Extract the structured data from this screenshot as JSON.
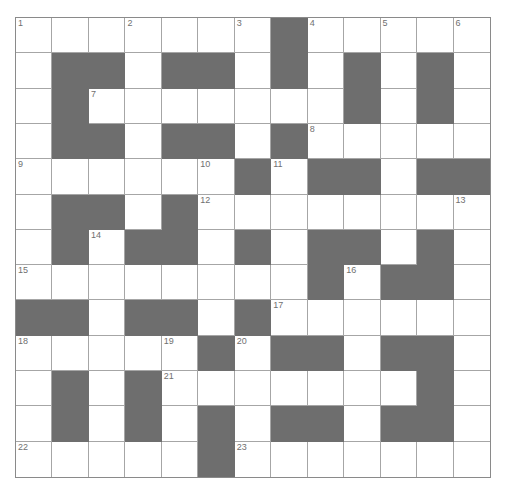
{
  "puzzle": {
    "rows": 13,
    "cols": 13,
    "colors": {
      "block": "#6e6e6e",
      "cell": "#ffffff",
      "grid_line": "#a6a6a6",
      "number": "#707070"
    },
    "layout": [
      "WWWWWWWBWWWWW",
      "WBBWBBWBWBWBW",
      "WBWWWWWWWBWBW",
      "WBBWBBWBWWWWW",
      "WWWWWWBWBBWBB",
      "WBBWBWWWWWWWW",
      "WBWBBWBWBBWBW",
      "WWWWWWWWBWBBW",
      "BBWBBWBWWWWWW",
      "WWWWWBWBBWBBW",
      "WBWBWWWWWWWBW",
      "WBWBWBWBBWBBW",
      "WWWWWBWWWWWWW"
    ],
    "numbers": [
      {
        "row": 0,
        "col": 0,
        "n": "1"
      },
      {
        "row": 0,
        "col": 3,
        "n": "2"
      },
      {
        "row": 0,
        "col": 6,
        "n": "3"
      },
      {
        "row": 0,
        "col": 8,
        "n": "4"
      },
      {
        "row": 0,
        "col": 10,
        "n": "5"
      },
      {
        "row": 0,
        "col": 12,
        "n": "6"
      },
      {
        "row": 2,
        "col": 2,
        "n": "7"
      },
      {
        "row": 3,
        "col": 8,
        "n": "8"
      },
      {
        "row": 4,
        "col": 0,
        "n": "9"
      },
      {
        "row": 4,
        "col": 5,
        "n": "10"
      },
      {
        "row": 4,
        "col": 7,
        "n": "11"
      },
      {
        "row": 5,
        "col": 5,
        "n": "12"
      },
      {
        "row": 5,
        "col": 12,
        "n": "13"
      },
      {
        "row": 6,
        "col": 2,
        "n": "14"
      },
      {
        "row": 7,
        "col": 0,
        "n": "15"
      },
      {
        "row": 7,
        "col": 9,
        "n": "16"
      },
      {
        "row": 8,
        "col": 7,
        "n": "17"
      },
      {
        "row": 9,
        "col": 0,
        "n": "18"
      },
      {
        "row": 9,
        "col": 4,
        "n": "19"
      },
      {
        "row": 9,
        "col": 6,
        "n": "20"
      },
      {
        "row": 10,
        "col": 4,
        "n": "21"
      },
      {
        "row": 12,
        "col": 0,
        "n": "22"
      },
      {
        "row": 12,
        "col": 6,
        "n": "23"
      }
    ]
  }
}
